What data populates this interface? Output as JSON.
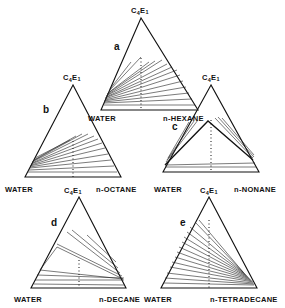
{
  "figure": {
    "panels": [
      {
        "id": "a",
        "label": "a",
        "apex": "C4E1",
        "left": "WATER",
        "right": "n-HEXANE"
      },
      {
        "id": "b",
        "label": "b",
        "apex": "C4E1",
        "left": "WATER",
        "right": "n-OCTANE"
      },
      {
        "id": "c",
        "label": "c",
        "apex": "C4E1",
        "left": "WATER",
        "right": "n-NONANE"
      },
      {
        "id": "d",
        "label": "d",
        "apex": "C4E1",
        "left": "WATER",
        "right": "n-DECANE"
      },
      {
        "id": "e",
        "label": "e",
        "apex": "C4E1",
        "left": "WATER",
        "right": "n-TETRADECANE"
      }
    ],
    "apex_label": "C4E1",
    "apex_main": "C",
    "apex_sub4": "4",
    "apex_e": "E",
    "apex_sub1": "1"
  },
  "labels": {
    "a": {
      "panel": "a",
      "left": "WATER",
      "right": "n-HEXANE"
    },
    "b": {
      "panel": "b",
      "left": "WATER",
      "right": "n-OCTANE"
    },
    "c": {
      "panel": "c",
      "left": "WATER",
      "right": "n-NONANE"
    },
    "d": {
      "panel": "d",
      "left": "WATER",
      "right": "n-DECANE"
    },
    "e": {
      "panel": "e",
      "left": "WATER",
      "right": "n-TETRADECANE"
    }
  }
}
